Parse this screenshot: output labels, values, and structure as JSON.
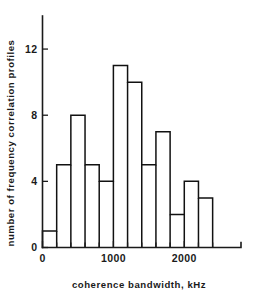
{
  "chart_data": {
    "type": "bar",
    "title": "",
    "xlabel": "coherence bandwidth, kHz",
    "ylabel": "number of frequency correlation profiles",
    "bin_width": 200,
    "bin_edges": [
      0,
      200,
      400,
      600,
      800,
      1000,
      1200,
      1400,
      1600,
      1800,
      2000,
      2200,
      2400
    ],
    "categories": [
      "0-200",
      "200-400",
      "400-600",
      "600-800",
      "800-1000",
      "1000-1200",
      "1200-1400",
      "1400-1600",
      "1600-1800",
      "1800-2000",
      "2000-2200",
      "2200-2400"
    ],
    "values": [
      1,
      5,
      8,
      5,
      4,
      11,
      10,
      5,
      7,
      2,
      4,
      3
    ],
    "xlim": [
      0,
      2800
    ],
    "ylim": [
      0,
      14
    ],
    "x_ticks": [
      0,
      1000,
      2000
    ],
    "x_tick_labels": [
      "0",
      "1000",
      "2000"
    ],
    "x_minor_ticks": [
      200,
      400,
      600,
      800,
      1200,
      1400,
      1600,
      1800,
      2200,
      2400
    ],
    "y_ticks": [
      0,
      4,
      8,
      12
    ],
    "y_tick_labels": [
      "0",
      "4",
      "8",
      "12"
    ],
    "grid": false,
    "legend": "none",
    "series": [
      {
        "name": "frequency correlation profiles",
        "values": [
          1,
          5,
          8,
          5,
          4,
          11,
          10,
          5,
          7,
          2,
          4,
          3
        ]
      }
    ]
  },
  "colors": {
    "axis": "#1a1a1a",
    "bar_outline": "#111111",
    "bar_fill": "#ffffff",
    "background": "#ffffff"
  }
}
